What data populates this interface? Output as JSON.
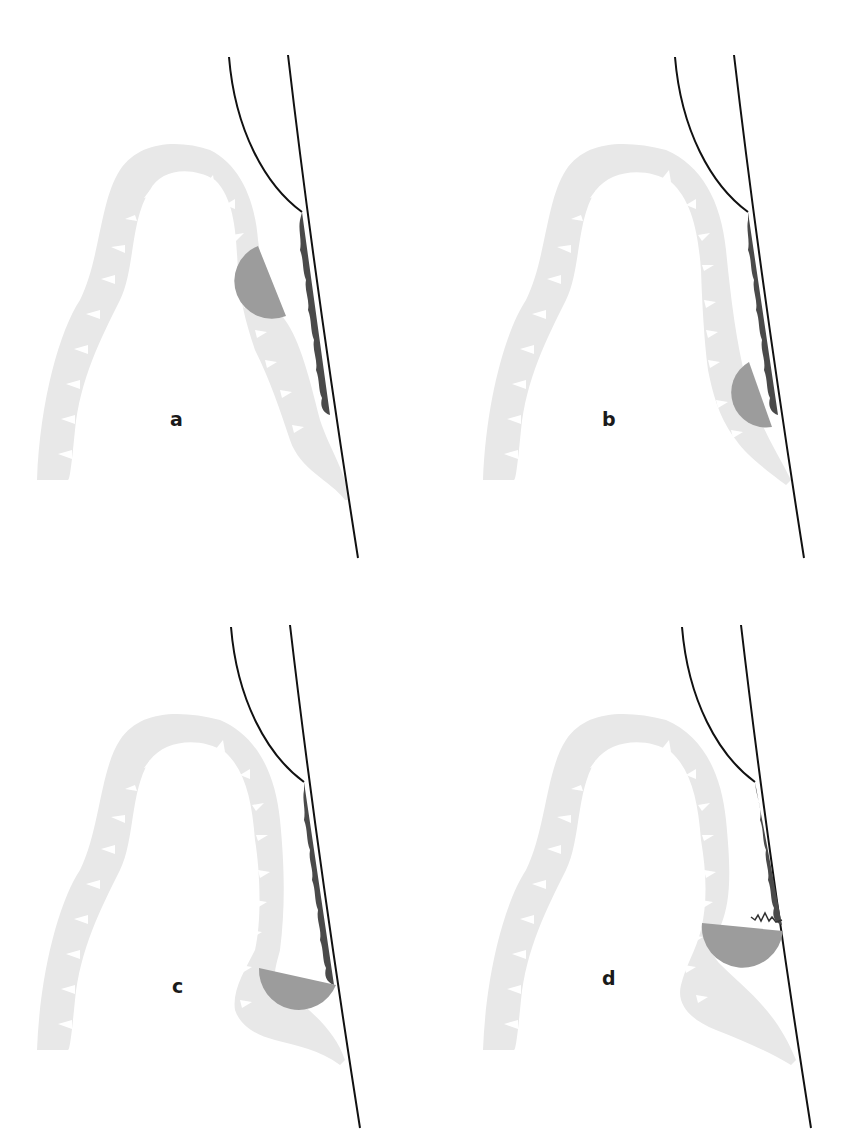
{
  "figure": {
    "panels": [
      {
        "id": "a",
        "label": "a",
        "disk_position": "upper",
        "dark_band_extent": "full",
        "notes": "half-disk adjacent to membrane folds, separate from dark band"
      },
      {
        "id": "b",
        "label": "b",
        "disk_position": "middle-lower",
        "dark_band_extent": "full",
        "notes": "half-disk moved down, touching dark band end"
      },
      {
        "id": "c",
        "label": "c",
        "disk_position": "lower",
        "dark_band_extent": "full",
        "notes": "half-disk flat side contacting line below dark band"
      },
      {
        "id": "d",
        "label": "d",
        "disk_position": "lower",
        "dark_band_extent": "full",
        "notes": "half-disk with jagged interface where dark band meets flat edge"
      }
    ],
    "colors": {
      "background": "#ffffff",
      "membrane": "#e8e8e8",
      "half_disk": "#9c9c9c",
      "dark_band": "#4a4a4a",
      "line": "#111111",
      "label": "#1a1a1a"
    }
  }
}
